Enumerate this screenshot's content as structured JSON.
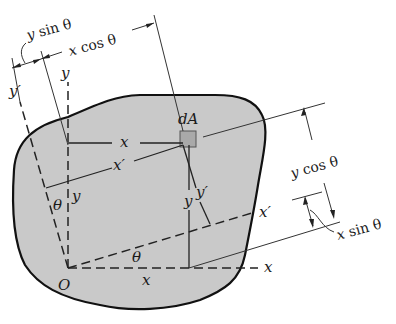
{
  "figure": {
    "labels": {
      "origin": "O",
      "x_axis": "x",
      "y_axis": "y",
      "x_prime_axis": "x′",
      "y_prime_axis": "y′",
      "element": "dA",
      "angle_top": "θ",
      "angle_bottom": "θ",
      "dist_x": "x",
      "dist_x_bottom": "x",
      "dist_x_prime": "x′",
      "dist_y_left": "y",
      "dist_y_right": "y",
      "dist_y_prime": "y′",
      "y_sin_theta": {
        "var": "y",
        "rest": " sin θ"
      },
      "x_cos_theta": {
        "var": "x",
        "rest": " cos θ"
      },
      "y_cos_theta": {
        "var": "y",
        "rest": " cos θ"
      },
      "x_sin_theta": {
        "var": "x",
        "rest": " sin θ"
      }
    },
    "colors": {
      "area_fill": "#c9c9c9",
      "element_fill": "#a9a9a9",
      "ink": "#1a1a1a"
    }
  }
}
